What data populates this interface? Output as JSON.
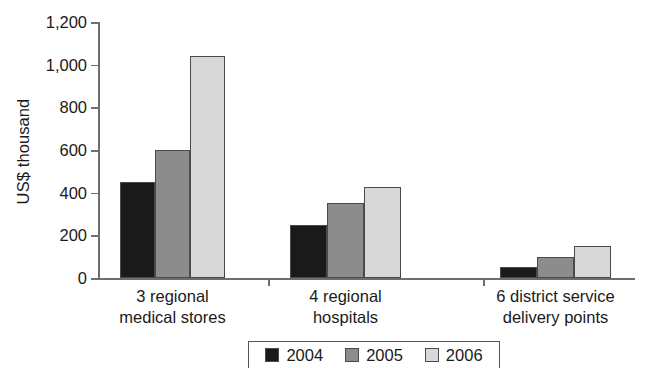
{
  "chart_data": {
    "type": "bar",
    "title": "",
    "xlabel": "",
    "ylabel": "US$ thousand",
    "ylim": [
      0,
      1200
    ],
    "yticks": [
      0,
      200,
      400,
      600,
      800,
      1000,
      1200
    ],
    "ytick_labels": [
      "0",
      "200",
      "400",
      "600",
      "800",
      "1,000",
      "1,200"
    ],
    "grid": false,
    "legend_position": "bottom-center",
    "categories": [
      "3 regional\nmedical stores",
      "4 regional\nhospitals",
      "6 district service\ndelivery points"
    ],
    "category_lines": [
      [
        "3 regional",
        "medical stores"
      ],
      [
        "4 regional",
        "hospitals"
      ],
      [
        "6 district service",
        "delivery points"
      ]
    ],
    "series": [
      {
        "name": "2004",
        "color": "#1a1a1a",
        "values": [
          450,
          250,
          50
        ]
      },
      {
        "name": "2005",
        "color": "#8c8c8c",
        "values": [
          600,
          350,
          100
        ]
      },
      {
        "name": "2006",
        "color": "#d8d8d8",
        "values": [
          1040,
          425,
          150
        ]
      }
    ]
  },
  "axis": {
    "y_title": "US$ thousand",
    "tick_labels": [
      "1,200",
      "1,000",
      "800",
      "600",
      "400",
      "200",
      "0"
    ]
  },
  "legend": {
    "items": [
      {
        "label": "2004",
        "color": "#1a1a1a"
      },
      {
        "label": "2005",
        "color": "#8c8c8c"
      },
      {
        "label": "2006",
        "color": "#d8d8d8"
      }
    ]
  }
}
